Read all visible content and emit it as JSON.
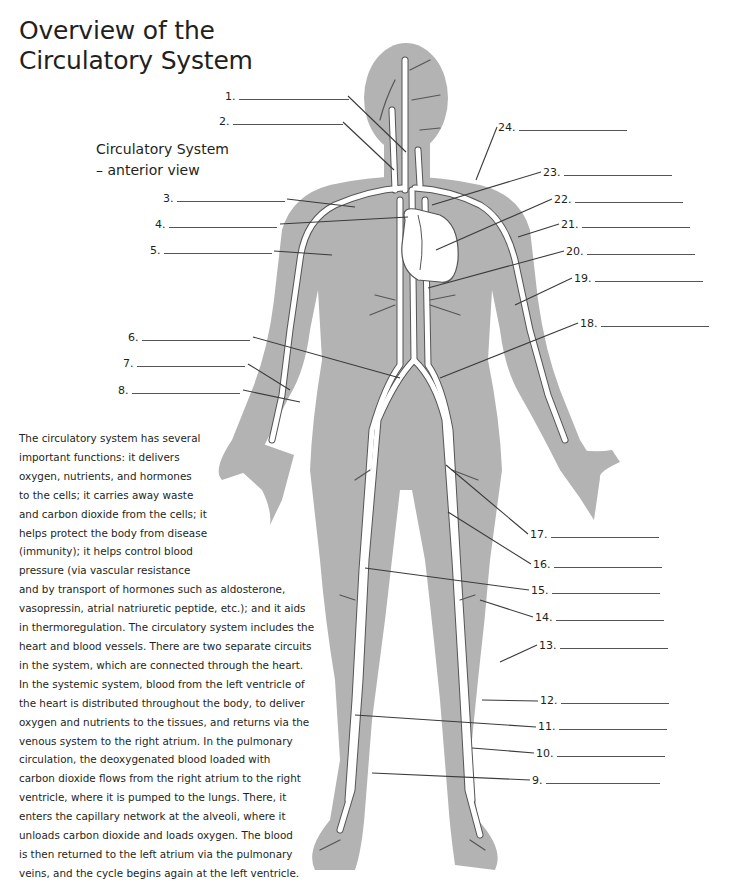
{
  "title": {
    "line1": "Overview of the",
    "line2": "Circulatory System"
  },
  "subtitle": {
    "line1": "Circulatory System",
    "line2": "– anterior view"
  },
  "colors": {
    "silhouette": "#b3b3b3",
    "vessel_fill": "#ffffff",
    "vessel_outline": "#555555",
    "leader_line": "#3a3a3a",
    "text": "#231f20"
  },
  "labels": [
    {
      "num": "1.",
      "x": 225,
      "y": 90,
      "blank_w": 110
    },
    {
      "num": "2.",
      "x": 219,
      "y": 115,
      "blank_w": 110
    },
    {
      "num": "3.",
      "x": 163,
      "y": 192,
      "blank_w": 108
    },
    {
      "num": "4.",
      "x": 155,
      "y": 218,
      "blank_w": 108
    },
    {
      "num": "5.",
      "x": 150,
      "y": 244,
      "blank_w": 108
    },
    {
      "num": "6.",
      "x": 128,
      "y": 331,
      "blank_w": 108
    },
    {
      "num": "7.",
      "x": 123,
      "y": 357,
      "blank_w": 108
    },
    {
      "num": "8.",
      "x": 118,
      "y": 384,
      "blank_w": 108
    },
    {
      "num": "9.",
      "x": 532,
      "y": 774,
      "blank_w": 114
    },
    {
      "num": "10.",
      "x": 536,
      "y": 747,
      "blank_w": 108
    },
    {
      "num": "11.",
      "x": 538,
      "y": 720,
      "blank_w": 108
    },
    {
      "num": "12.",
      "x": 540,
      "y": 694,
      "blank_w": 108
    },
    {
      "num": "13.",
      "x": 539,
      "y": 639,
      "blank_w": 108
    },
    {
      "num": "14.",
      "x": 535,
      "y": 611,
      "blank_w": 108
    },
    {
      "num": "15.",
      "x": 531,
      "y": 584,
      "blank_w": 108
    },
    {
      "num": "16.",
      "x": 533,
      "y": 558,
      "blank_w": 108
    },
    {
      "num": "17.",
      "x": 530,
      "y": 528,
      "blank_w": 108
    },
    {
      "num": "18.",
      "x": 580,
      "y": 317,
      "blank_w": 108
    },
    {
      "num": "19.",
      "x": 574,
      "y": 272,
      "blank_w": 108
    },
    {
      "num": "20.",
      "x": 566,
      "y": 245,
      "blank_w": 108
    },
    {
      "num": "21.",
      "x": 561,
      "y": 218,
      "blank_w": 108
    },
    {
      "num": "22.",
      "x": 554,
      "y": 193,
      "blank_w": 108
    },
    {
      "num": "23.",
      "x": 543,
      "y": 166,
      "blank_w": 108
    },
    {
      "num": "24.",
      "x": 498,
      "y": 121,
      "blank_w": 108
    }
  ],
  "description": {
    "lines": [
      "The circulatory system has several",
      "important functions: it delivers",
      "oxygen, nutrients, and hormones",
      "to the cells; it carries away waste",
      "and carbon dioxide from the cells; it",
      "helps protect the body from disease",
      "(immunity); it helps control blood",
      "pressure (via vascular resistance",
      "and by transport of hormones such as aldosterone,",
      "vasopressin, atrial natriuretic peptide, etc.); and it aids",
      "in thermoregulation. The circulatory system includes the",
      "heart and blood vessels. There are two separate circuits",
      "in the system, which are connected through the heart.",
      "In the systemic system, blood from the left ventricle of",
      "the heart is distributed throughout the body, to deliver",
      "oxygen and nutrients to the tissues, and returns via the",
      "venous system to the right atrium. In the pulmonary",
      "circulation, the deoxygenated blood loaded with",
      "carbon dioxide flows from the right atrium to the right",
      "ventricle, where it is pumped to the lungs. There, it",
      "enters the capillary network at the alveoli, where it",
      "unloads carbon dioxide and loads oxygen. The blood",
      "is then returned to the left atrium via the pulmonary",
      "veins, and the cycle begins again at the left ventricle."
    ]
  }
}
